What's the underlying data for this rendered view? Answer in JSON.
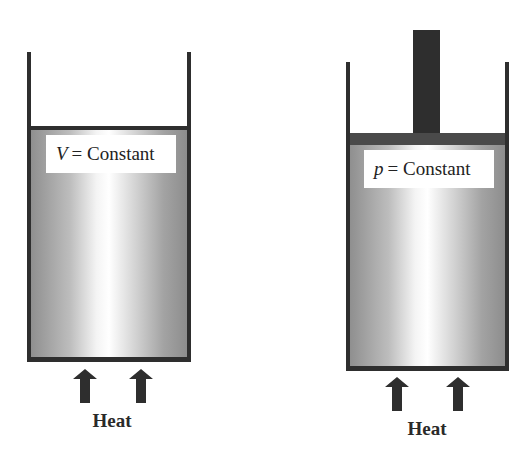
{
  "left_panel": {
    "label_variable": "V",
    "label_text": "= Constant",
    "heat_label": "Heat",
    "arrows": 2
  },
  "right_panel": {
    "label_variable": "p",
    "label_text": "= Constant",
    "heat_label": "Heat",
    "arrows": 2,
    "has_piston": true
  },
  "colors": {
    "wall": "#2e2e2e",
    "piston": "#4a4a4a",
    "fluid_dark": "#8f8f8f",
    "fluid_light": "#ffffff"
  }
}
